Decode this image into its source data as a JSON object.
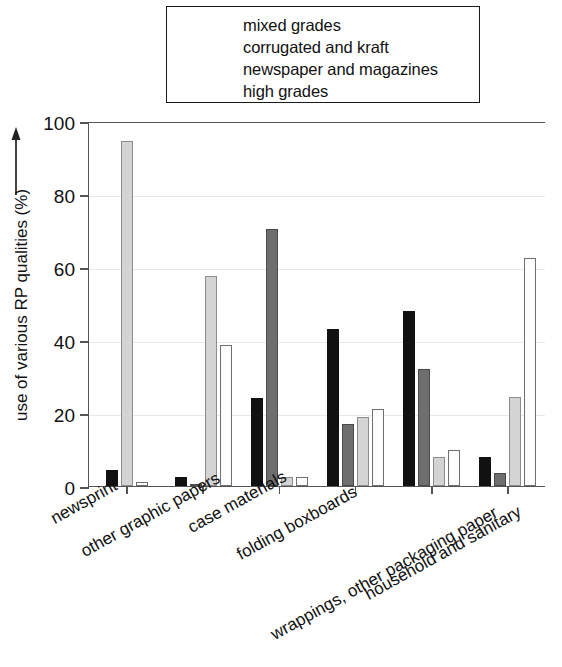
{
  "chart_data": {
    "type": "bar",
    "title": "",
    "xlabel": "",
    "ylabel": "use of various RP qualities (%)",
    "ylim": [
      0,
      100
    ],
    "yticks": [
      0,
      20,
      40,
      60,
      80,
      100
    ],
    "ytick_labels": [
      "0",
      "20",
      "40",
      "60",
      "80",
      "100"
    ],
    "grid": true,
    "legend_position": "top-center",
    "categories": [
      "newsprint",
      "other graphic papers",
      "case materials",
      "folding boxboards",
      "wrappings, other packaging paper",
      "household and sanitary"
    ],
    "series": [
      {
        "name": "mixed grades",
        "color": "#111111",
        "values": [
          4.5,
          2.5,
          24.0,
          43.0,
          48.0,
          8.0
        ]
      },
      {
        "name": "corrugated and kraft",
        "color": "#6e6e6e",
        "values": [
          0.0,
          0.6,
          70.5,
          17.0,
          32.0,
          3.5
        ]
      },
      {
        "name": "newspaper and magazines",
        "color": "#d4d4d4",
        "values": [
          94.5,
          57.5,
          2.5,
          19.0,
          8.0,
          24.5
        ]
      },
      {
        "name": "high grades",
        "color": "#fdfdfd",
        "values": [
          1.0,
          38.5,
          2.5,
          21.0,
          10.0,
          62.5
        ]
      }
    ]
  },
  "legend": {
    "items": [
      {
        "label": "mixed grades"
      },
      {
        "label": "corrugated and kraft"
      },
      {
        "label": "newspaper and magazines"
      },
      {
        "label": "high grades"
      }
    ]
  },
  "axis": {
    "y_title": "use of various RP qualities (%)"
  }
}
